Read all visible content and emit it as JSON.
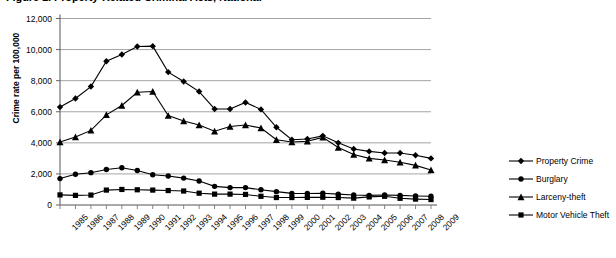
{
  "figure": {
    "title": "Figure 1.  Property-Related Criminal Acts, National",
    "title_clipped": true
  },
  "chart_data": {
    "type": "line",
    "title": "Figure 1.  Property-Related Criminal Acts, National",
    "xlabel": "",
    "ylabel": "Crime rate per 100,000",
    "ylim": [
      0,
      12000
    ],
    "ytick_step": 2000,
    "grid": true,
    "legend_position": "right",
    "ytick_labels": [
      "0",
      "2,000",
      "4,000",
      "6,000",
      "8,000",
      "10,000",
      "12,000"
    ],
    "categories": [
      "1985",
      "1986",
      "1987",
      "1988",
      "1989",
      "1990",
      "1991",
      "1992",
      "1993",
      "1994",
      "1995",
      "1996",
      "1997",
      "1998",
      "1999",
      "2000",
      "2001",
      "2002",
      "2003",
      "2004",
      "2005",
      "2006",
      "2007",
      "2008",
      "2009"
    ],
    "series": [
      {
        "name": "Property Crime",
        "marker": "diamond",
        "color": "#000000",
        "values": [
          6300,
          6850,
          7620,
          9250,
          9680,
          10200,
          10220,
          8550,
          7950,
          7300,
          6180,
          6180,
          6600,
          6150,
          5000,
          4200,
          4250,
          4450,
          4000,
          3600,
          3450,
          3350,
          3350,
          3200,
          3000
        ]
      },
      {
        "name": "Burglary",
        "marker": "circle",
        "color": "#000000",
        "values": [
          1700,
          1980,
          2080,
          2280,
          2400,
          2220,
          1950,
          1870,
          1730,
          1540,
          1200,
          1120,
          1120,
          980,
          860,
          750,
          740,
          760,
          700,
          640,
          620,
          640,
          620,
          580,
          560
        ]
      },
      {
        "name": "Larceny-theft",
        "marker": "triangle",
        "color": "#000000",
        "values": [
          4050,
          4380,
          4800,
          5800,
          6400,
          7250,
          7300,
          5750,
          5400,
          5150,
          4750,
          5050,
          5150,
          4950,
          4200,
          4050,
          4100,
          4350,
          3700,
          3250,
          3000,
          2900,
          2750,
          2550,
          2250
        ]
      },
      {
        "name": "Motor Vehicle Theft",
        "marker": "square",
        "color": "#000000",
        "values": [
          650,
          620,
          640,
          960,
          1000,
          980,
          960,
          930,
          900,
          760,
          700,
          700,
          680,
          560,
          480,
          480,
          490,
          500,
          480,
          440,
          520,
          560,
          430,
          380,
          350
        ]
      }
    ]
  }
}
